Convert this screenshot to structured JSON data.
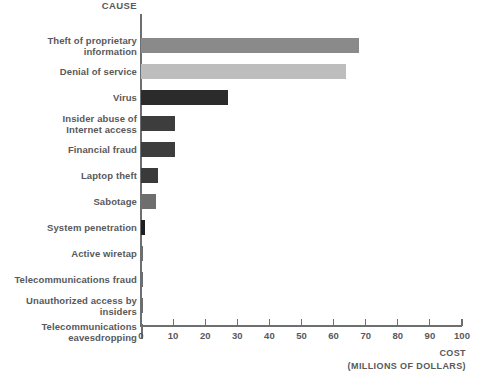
{
  "header": {
    "category_axis_title": "CAUSE"
  },
  "axis": {
    "title_line1": "COST",
    "title_line2": "(MILLIONS OF DOLLARS)",
    "tick_labels": [
      "0",
      "10",
      "20",
      "30",
      "40",
      "50",
      "60",
      "70",
      "80",
      "90",
      "100"
    ]
  },
  "chart_data": {
    "type": "bar",
    "orientation": "horizontal",
    "title": "",
    "xlabel": "COST (MILLIONS OF DOLLARS)",
    "ylabel": "CAUSE",
    "xlim": [
      0,
      100
    ],
    "xticks": [
      0,
      10,
      20,
      30,
      40,
      50,
      60,
      70,
      80,
      90,
      100
    ],
    "grid": false,
    "legend": false,
    "categories": [
      "Theft of proprietary information",
      "Denial of service",
      "Virus",
      "Insider abuse of Internet access",
      "Financial fraud",
      "Laptop theft",
      "Sabotage",
      "System penetration",
      "Active wiretap",
      "Telecommunications fraud",
      "Unauthorized access by insiders",
      "Telecommunications eavesdropping"
    ],
    "category_labels": [
      "Theft of proprietary\ninformation",
      "Denial of service",
      "Virus",
      "Insider abuse of\nInternet access",
      "Financial fraud",
      "Laptop theft",
      "Sabotage",
      "System penetration",
      "Active wiretap",
      "Telecommunications fraud",
      "Unauthorized access by\ninsiders",
      "Telecommunications\neavesdropping"
    ],
    "values": [
      68,
      64,
      27,
      10.5,
      10.5,
      5.3,
      4.8,
      1.2,
      0.5,
      0.5,
      0.5,
      0.5
    ],
    "colors": [
      "#8a8a8a",
      "#bdbdbd",
      "#2b2b2b",
      "#3d3d3d",
      "#3d3d3d",
      "#3a3a3a",
      "#6e6e6e",
      "#1f1f1f",
      "#6d6e70",
      "#6d6e70",
      "#6d6e70",
      "#6d6e70"
    ]
  },
  "style": {
    "background": "#ffffff",
    "axis_color": "#6d6e70",
    "text_color": "#58595b"
  }
}
